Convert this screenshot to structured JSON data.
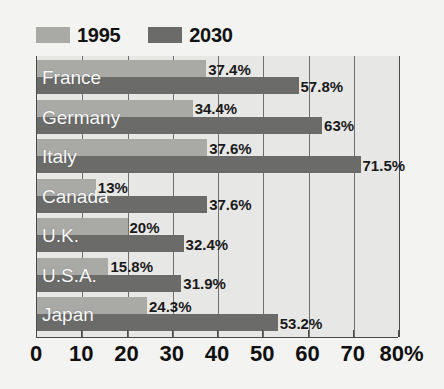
{
  "chart_data": {
    "type": "bar",
    "orientation": "horizontal",
    "title": "",
    "xlabel": "",
    "ylabel": "",
    "xlim": [
      0,
      80
    ],
    "xtick_labels": [
      "0",
      "10",
      "20",
      "30",
      "40",
      "50",
      "60",
      "70",
      "80%"
    ],
    "xticks": [
      0,
      10,
      20,
      30,
      40,
      50,
      60,
      70,
      80
    ],
    "grid": true,
    "legend_position": "top-left",
    "categories": [
      "France",
      "Germany",
      "Italy",
      "Canada",
      "U.K.",
      "U.S.A.",
      "Japan"
    ],
    "series": [
      {
        "name": "1995",
        "color": "#a9a9a6",
        "values": [
          37.4,
          34.4,
          37.6,
          13,
          20,
          15.8,
          24.3
        ],
        "labels": [
          "37.4%",
          "34.4%",
          "37.6%",
          "13%",
          "20%",
          "15.8%",
          "24.3%"
        ]
      },
      {
        "name": "2030",
        "color": "#6b6b69",
        "values": [
          57.8,
          63,
          71.5,
          37.6,
          32.4,
          31.9,
          53.2
        ],
        "labels": [
          "57.8%",
          "63%",
          "71.5%",
          "37.6%",
          "32.4%",
          "31.9%",
          "53.2%"
        ]
      }
    ]
  },
  "legend": {
    "items": [
      {
        "label": "1995",
        "color": "#a9a9a6"
      },
      {
        "label": "2030",
        "color": "#6b6b69"
      }
    ]
  },
  "colors": {
    "background": "#f3f3f1",
    "plot_background": "#e7e7e5",
    "gridline": "#6f6f6f",
    "axis": "#4a4a4a",
    "label_text": "#fafafa",
    "value_text": "#1a1a1a"
  }
}
